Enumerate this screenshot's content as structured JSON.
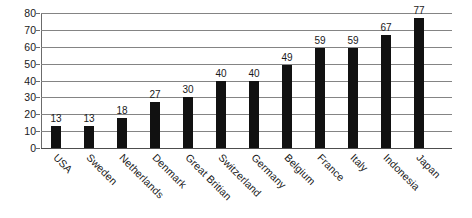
{
  "chart_data": {
    "type": "bar",
    "title": "",
    "subtitle": "",
    "xlabel": "",
    "ylabel": "",
    "ylim": [
      0,
      80
    ],
    "ytick_step": 10,
    "yticks": [
      80,
      70,
      60,
      50,
      40,
      30,
      20,
      10,
      0
    ],
    "grid": true,
    "legend": false,
    "legend_position": "none",
    "bar_color": "#111111",
    "gridline_color": "#848484",
    "axis_color": "#6b6b6b",
    "background_color": "#ffffff",
    "categories": [
      "USA",
      "Sweden",
      "Netherlands",
      "Denmark",
      "Great Britian",
      "Switzerland",
      "Germany",
      "Belgium",
      "France",
      "Italy",
      "Indonesia",
      "Japan"
    ],
    "values": [
      13,
      13,
      18,
      27,
      30,
      40,
      40,
      49,
      59,
      59,
      67,
      77
    ],
    "data_labels": [
      "13",
      "13",
      "18",
      "27",
      "30",
      "40",
      "40",
      "49",
      "59",
      "59",
      "67",
      "77"
    ]
  }
}
